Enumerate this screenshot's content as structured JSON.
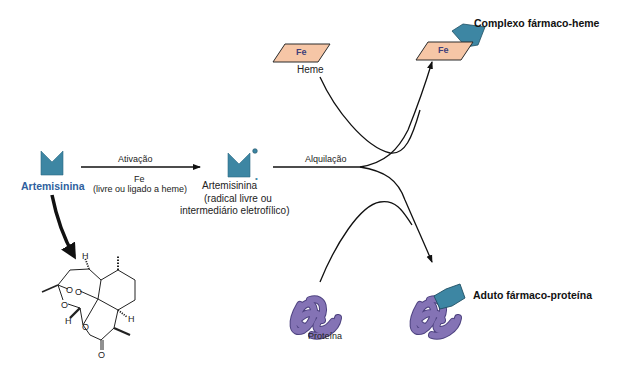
{
  "colors": {
    "drug": "#3d86a3",
    "drug_stroke": "#1f4f63",
    "heme_fill": "#f6c6a6",
    "heme_stroke": "#2b2b2b",
    "fe_text": "#3f3f7a",
    "protein": "#7a6aa8",
    "protein_dark": "#4e4380",
    "artemisinin_label": "#2f5f9e",
    "arrow": "#111111"
  },
  "nodes": {
    "artemisinin": {
      "label": "Artemisinina"
    },
    "activated": {
      "label": "Artemisinina",
      "radical_dot": "•",
      "sub1": "(radical livre ou",
      "sub2": "intermediário eletrofílico)"
    },
    "heme": {
      "fe": "Fe",
      "label": "Heme"
    },
    "protein": {
      "label": "Proteína"
    },
    "complex_heme": {
      "fe": "Fe",
      "label": "Complexo fármaco-heme"
    },
    "adduct_protein": {
      "label": "Aduto fármaco-proteína"
    }
  },
  "arrows": {
    "activation": {
      "label_top": "Ativação",
      "label_fe": "Fe",
      "label_sub": "(livre ou ligado a heme)"
    },
    "alkylation": {
      "label": "Alquilação"
    }
  },
  "structure": {
    "atoms": {
      "o1": "O",
      "o2": "O",
      "o3": "O",
      "o4": "O",
      "o5": "O",
      "h1": "H",
      "h2": "H",
      "h3": "H"
    }
  }
}
